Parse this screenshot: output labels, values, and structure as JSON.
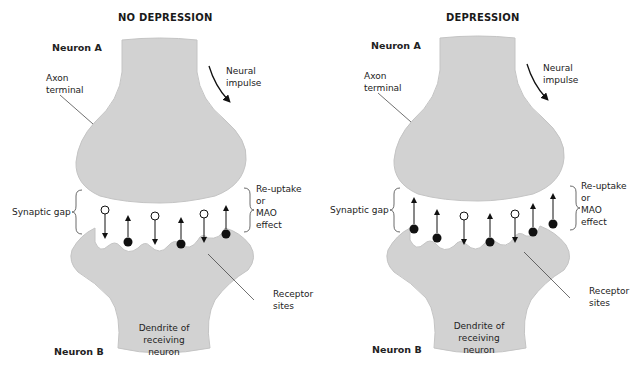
{
  "colors": {
    "neuron_fill": "#d2d2d2",
    "neuron_stroke": "#bdbdbd",
    "transmitter_filled": "#111111",
    "transmitter_empty": "#ffffff",
    "text": "#1a1a1a"
  },
  "panels": [
    {
      "title": "NO DEPRESSION",
      "labels": {
        "neuron_a": "Neuron A",
        "axon_terminal_1": "Axon",
        "axon_terminal_2": "terminal",
        "neural_impulse_1": "Neural",
        "neural_impulse_2": "impulse",
        "synaptic_gap": "Synaptic gap",
        "reuptake_1": "Re-uptake",
        "reuptake_2": "or",
        "reuptake_3": "MAO",
        "reuptake_4": "effect",
        "receptor_1": "Receptor",
        "receptor_2": "sites",
        "dendrite_1": "Dendrite of",
        "dendrite_2": "receiving",
        "dendrite_3": "neuron",
        "neuron_b": "Neuron B"
      },
      "transmitters": [
        {
          "type": "open",
          "direction": "down"
        },
        {
          "type": "filled",
          "direction": "up"
        },
        {
          "type": "open",
          "direction": "down"
        },
        {
          "type": "filled",
          "direction": "up"
        },
        {
          "type": "open",
          "direction": "down"
        },
        {
          "type": "filled",
          "direction": "up"
        }
      ]
    },
    {
      "title": "DEPRESSION",
      "labels": {
        "neuron_a": "Neuron A",
        "axon_terminal_1": "Axon",
        "axon_terminal_2": "terminal",
        "neural_impulse_1": "Neural",
        "neural_impulse_2": "impulse",
        "synaptic_gap": "Synaptic gap",
        "reuptake_1": "Re-uptake",
        "reuptake_2": "or",
        "reuptake_3": "MAO",
        "reuptake_4": "effect",
        "receptor_1": "Receptor",
        "receptor_2": "sites",
        "dendrite_1": "Dendrite of",
        "dendrite_2": "receiving",
        "dendrite_3": "neuron",
        "neuron_b": "Neuron B"
      },
      "transmitters": [
        {
          "type": "filled",
          "direction": "up"
        },
        {
          "type": "filled",
          "direction": "up"
        },
        {
          "type": "open",
          "direction": "down"
        },
        {
          "type": "filled",
          "direction": "up"
        },
        {
          "type": "open",
          "direction": "down"
        },
        {
          "type": "filled",
          "direction": "up"
        },
        {
          "type": "filled",
          "direction": "up"
        }
      ]
    }
  ]
}
